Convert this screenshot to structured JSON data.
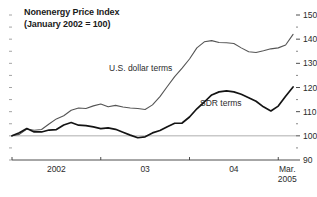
{
  "chart_data": {
    "type": "line",
    "title": "Nonenergy Price Index",
    "subtitle": "(January 2002 = 100)",
    "xlabel": "",
    "ylabel": "",
    "ylim": [
      90,
      150
    ],
    "y_ticks": [
      90,
      100,
      110,
      120,
      130,
      140,
      150
    ],
    "y_tick_labels": [
      "90",
      "100",
      "110",
      "120",
      "130",
      "140",
      "150"
    ],
    "y_minor_step": 5,
    "y_axis_position": "right",
    "grid": false,
    "reference_line": 100,
    "x_ticks": [
      2002.0,
      2003.0,
      2004.0,
      2005.0
    ],
    "x_tick_labels": [
      "2002",
      "03",
      "04",
      "Mar.\n2005"
    ],
    "x_end_label_line1": "Mar.",
    "x_end_label_line2": "2005",
    "xlim": [
      2002.0,
      2005.2
    ],
    "legend_position": "inline-annotations",
    "series": [
      {
        "name": "U.S. dollar terms",
        "color": "#555555",
        "width": 1.1,
        "x": [
          2002.0,
          2002.083,
          2002.167,
          2002.25,
          2002.333,
          2002.417,
          2002.5,
          2002.583,
          2002.667,
          2002.75,
          2002.833,
          2002.917,
          2003.0,
          2003.083,
          2003.167,
          2003.25,
          2003.333,
          2003.417,
          2003.5,
          2003.583,
          2003.667,
          2003.75,
          2003.833,
          2003.917,
          2004.0,
          2004.083,
          2004.167,
          2004.25,
          2004.333,
          2004.417,
          2004.5,
          2004.583,
          2004.667,
          2004.75,
          2004.833,
          2004.917,
          2005.0,
          2005.083,
          2005.167
        ],
        "values": [
          100.0,
          100.6,
          102.8,
          102.3,
          102.6,
          104.9,
          107.0,
          108.3,
          110.6,
          111.5,
          111.3,
          112.4,
          113.2,
          112.0,
          112.6,
          111.9,
          111.5,
          111.3,
          110.9,
          112.8,
          116.2,
          120.4,
          124.5,
          128.0,
          131.8,
          136.4,
          138.9,
          139.4,
          138.6,
          138.5,
          138.2,
          136.4,
          134.8,
          134.5,
          135.2,
          136.0,
          136.4,
          137.6,
          142.0
        ]
      },
      {
        "name": "SDR terms",
        "color": "#141414",
        "width": 1.7,
        "x": [
          2002.0,
          2002.083,
          2002.167,
          2002.25,
          2002.333,
          2002.417,
          2002.5,
          2002.583,
          2002.667,
          2002.75,
          2002.833,
          2002.917,
          2003.0,
          2003.083,
          2003.167,
          2003.25,
          2003.333,
          2003.417,
          2003.5,
          2003.583,
          2003.667,
          2003.75,
          2003.833,
          2003.917,
          2004.0,
          2004.083,
          2004.167,
          2004.25,
          2004.333,
          2004.417,
          2004.5,
          2004.583,
          2004.667,
          2004.75,
          2004.833,
          2004.917,
          2005.0,
          2005.083,
          2005.167
        ],
        "values": [
          100.0,
          101.3,
          103.0,
          101.6,
          101.6,
          102.4,
          102.6,
          104.5,
          105.5,
          104.4,
          104.2,
          103.7,
          103.0,
          103.3,
          102.7,
          101.5,
          100.3,
          99.2,
          99.6,
          101.2,
          102.2,
          103.8,
          105.2,
          105.3,
          107.8,
          111.2,
          114.0,
          116.9,
          118.2,
          118.6,
          118.2,
          117.2,
          115.8,
          114.3,
          112.0,
          110.3,
          112.3,
          116.4,
          120.2
        ]
      }
    ]
  },
  "axis": {
    "left_tick_count": 13
  }
}
